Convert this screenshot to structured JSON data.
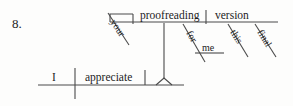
{
  "exercise": {
    "number_label": "8.",
    "diagram_type": "reed-kellogg-sentence-diagram"
  },
  "diagram": {
    "base_clause": {
      "subject": "I",
      "verb": "appreciate"
    },
    "gerund_phrase": {
      "gerund": "proofreading",
      "possessive_modifier": "your",
      "direct_object": "version",
      "object_modifiers": [
        "this",
        "final"
      ],
      "prepositional_phrase": {
        "preposition": "for",
        "object": "me"
      }
    },
    "words": {
      "subject": "I",
      "verb": "appreciate",
      "your": "your",
      "proofreading": "proofreading",
      "version": "version",
      "for": "for",
      "me": "me",
      "this": "this",
      "final": "final"
    },
    "colors": {
      "line": "#4a4a4a",
      "text": "#1c1c1c",
      "background": "#fdfdfc"
    }
  }
}
